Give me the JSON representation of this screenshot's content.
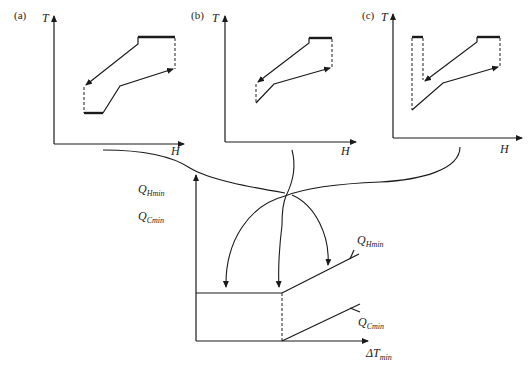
{
  "panels": [
    {
      "id": "a",
      "label": "(a)",
      "y_axis": "T",
      "x_axis": "H"
    },
    {
      "id": "b",
      "label": "(b)",
      "y_axis": "T",
      "x_axis": "H"
    },
    {
      "id": "c",
      "label": "(c)",
      "y_axis": "T",
      "x_axis": "H"
    }
  ],
  "bottom_chart": {
    "y_labels": {
      "q_hmin": {
        "main": "Q",
        "sub": "Hmin"
      },
      "q_cmin": {
        "main": "Q",
        "sub": "Cmin"
      }
    },
    "line_labels": {
      "q_hmin": {
        "main": "Q",
        "sub": "Hmin"
      },
      "q_cmin": {
        "main": "Q",
        "sub": "Cmin"
      }
    },
    "x_label": {
      "main": "ΔT",
      "sub": "min"
    }
  },
  "colors": {
    "line": "#1a1a1a",
    "background": "#ffffff"
  }
}
